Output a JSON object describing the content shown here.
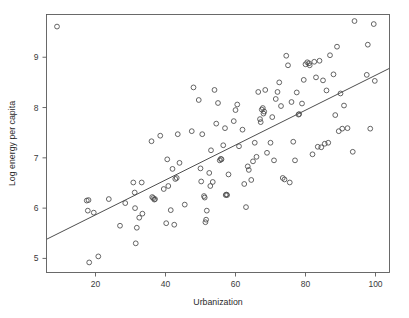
{
  "chart_data": {
    "type": "scatter",
    "title": "",
    "xlabel": "Urbanization",
    "ylabel": "Log energy per capita",
    "xlim": [
      6,
      104
    ],
    "ylim": [
      4.72,
      9.85
    ],
    "xticks": [
      20,
      40,
      60,
      80,
      100
    ],
    "yticks": [
      5,
      6,
      7,
      8,
      9
    ],
    "grid": false,
    "legend": null,
    "marker": "open-circle",
    "series": [
      {
        "name": "countries",
        "points": [
          [
            9,
            9.61
          ],
          [
            17.5,
            6.15
          ],
          [
            18,
            6.16
          ],
          [
            17.8,
            5.95
          ],
          [
            18.2,
            4.92
          ],
          [
            19.5,
            5.91
          ],
          [
            20.8,
            5.04
          ],
          [
            23.8,
            6.18
          ],
          [
            27,
            5.65
          ],
          [
            28.5,
            6.1
          ],
          [
            30.8,
            6.51
          ],
          [
            31.2,
            6.31
          ],
          [
            31.3,
            6.0
          ],
          [
            31.5,
            5.3
          ],
          [
            31.8,
            5.61
          ],
          [
            32.5,
            5.81
          ],
          [
            33.2,
            6.51
          ],
          [
            33.4,
            5.89
          ],
          [
            36,
            7.33
          ],
          [
            36.2,
            6.22
          ],
          [
            36.5,
            6.2
          ],
          [
            36.8,
            6.17
          ],
          [
            37,
            6.18
          ],
          [
            38.5,
            7.44
          ],
          [
            39.5,
            6.38
          ],
          [
            40.2,
            5.7
          ],
          [
            40.5,
            6.97
          ],
          [
            40.8,
            6.44
          ],
          [
            41.5,
            5.96
          ],
          [
            42,
            6.78
          ],
          [
            42.5,
            5.67
          ],
          [
            42.8,
            6.58
          ],
          [
            43.2,
            6.6
          ],
          [
            43.5,
            7.47
          ],
          [
            44,
            6.9
          ],
          [
            45.5,
            6.07
          ],
          [
            47.5,
            7.53
          ],
          [
            48,
            8.4
          ],
          [
            49.5,
            8.15
          ],
          [
            50,
            6.79
          ],
          [
            50.2,
            6.53
          ],
          [
            50.5,
            7.47
          ],
          [
            51,
            6.24
          ],
          [
            51.2,
            6.21
          ],
          [
            51.4,
            5.72
          ],
          [
            51.6,
            5.77
          ],
          [
            51.8,
            5.95
          ],
          [
            52.5,
            6.7
          ],
          [
            52.8,
            6.44
          ],
          [
            53,
            7.15
          ],
          [
            53.5,
            6.52
          ],
          [
            54,
            8.35
          ],
          [
            54.5,
            7.68
          ],
          [
            55,
            8.09
          ],
          [
            55.5,
            6.95
          ],
          [
            55.8,
            6.98
          ],
          [
            56,
            6.97
          ],
          [
            56.5,
            7.25
          ],
          [
            57,
            7.59
          ],
          [
            57.2,
            6.26
          ],
          [
            57.4,
            6.27
          ],
          [
            57.6,
            6.26
          ],
          [
            58,
            6.67
          ],
          [
            59.5,
            7.73
          ],
          [
            60,
            7.95
          ],
          [
            60.5,
            8.06
          ],
          [
            61,
            7.23
          ],
          [
            62,
            7.56
          ],
          [
            62.5,
            6.48
          ],
          [
            63,
            6.02
          ],
          [
            63.5,
            6.83
          ],
          [
            63.8,
            6.76
          ],
          [
            64.5,
            6.56
          ],
          [
            65,
            6.93
          ],
          [
            65.5,
            7.3
          ],
          [
            66,
            7.02
          ],
          [
            66.5,
            8.31
          ],
          [
            67,
            7.77
          ],
          [
            67.2,
            7.71
          ],
          [
            67.5,
            7.96
          ],
          [
            67.8,
            7.99
          ],
          [
            68,
            7.88
          ],
          [
            68.2,
            7.92
          ],
          [
            68.5,
            8.35
          ],
          [
            69,
            7.1
          ],
          [
            70,
            7.3
          ],
          [
            70.5,
            7.81
          ],
          [
            71,
            6.95
          ],
          [
            71.5,
            8.17
          ],
          [
            72,
            8.31
          ],
          [
            72.5,
            8.5
          ],
          [
            73,
            8.03
          ],
          [
            73.5,
            6.6
          ],
          [
            74,
            6.57
          ],
          [
            74.5,
            9.03
          ],
          [
            75,
            8.84
          ],
          [
            75.5,
            6.51
          ],
          [
            76,
            8.11
          ],
          [
            76.5,
            7.32
          ],
          [
            77,
            6.95
          ],
          [
            77.5,
            8.3
          ],
          [
            78,
            7.86
          ],
          [
            78.2,
            7.87
          ],
          [
            79,
            8.08
          ],
          [
            79.5,
            8.55
          ],
          [
            80,
            8.86
          ],
          [
            80.5,
            8.9
          ],
          [
            81,
            8.88
          ],
          [
            81.2,
            8.84
          ],
          [
            82,
            7.07
          ],
          [
            82.5,
            8.91
          ],
          [
            83,
            8.6
          ],
          [
            83.5,
            7.22
          ],
          [
            84,
            8.93
          ],
          [
            84.5,
            7.21
          ],
          [
            85,
            8.54
          ],
          [
            85.5,
            7.28
          ],
          [
            86,
            8.34
          ],
          [
            86.5,
            7.3
          ],
          [
            87,
            9.04
          ],
          [
            88,
            8.66
          ],
          [
            88.5,
            7.85
          ],
          [
            89,
            9.21
          ],
          [
            89.5,
            7.53
          ],
          [
            90,
            8.28
          ],
          [
            90.5,
            7.58
          ],
          [
            91,
            8.04
          ],
          [
            92,
            7.59
          ],
          [
            93.5,
            7.12
          ],
          [
            94,
            9.72
          ],
          [
            97.5,
            8.65
          ],
          [
            97.8,
            9.25
          ],
          [
            98.5,
            7.58
          ],
          [
            99.5,
            9.66
          ],
          [
            99.8,
            8.53
          ]
        ]
      }
    ],
    "fit_line": {
      "label": "regression line",
      "x0": 6,
      "y0": 5.38,
      "x1": 104,
      "y1": 8.78
    }
  }
}
